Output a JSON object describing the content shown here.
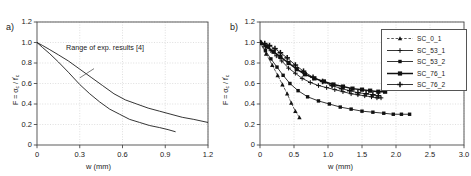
{
  "figure": {
    "panel_a_label": "a)",
    "panel_b_label": "b)",
    "xlabel": "w (mm)",
    "ylabel_prefix": "F = ",
    "ylabel_sigma": "σ",
    "ylabel_sigma_sub": "c",
    "ylabel_slash": " / ",
    "ylabel_f": "f",
    "ylabel_f_sup": "'",
    "ylabel_f_sub": "c",
    "annotation_a": "Range of exp. results [4]"
  },
  "chart_data": [
    {
      "type": "line",
      "panel": "a)",
      "title": "",
      "xlabel": "w (mm)",
      "ylabel": "F = σc / f'c",
      "xlim": [
        0,
        1.2
      ],
      "ylim": [
        0,
        1.2
      ],
      "xticks": [
        0,
        0.3,
        0.6,
        0.9,
        1.2
      ],
      "xtick_labels": [
        "0",
        "0.3",
        "0.6",
        "0.9",
        "1.2"
      ],
      "yticks": [
        0,
        0.2,
        0.4,
        0.6,
        0.8,
        1.0,
        1.2
      ],
      "ytick_labels": [
        "0",
        "0.2",
        "0.4",
        "0.6",
        "0.8",
        "1.0",
        "1.2"
      ],
      "grid": true,
      "legend": "none",
      "annotations": [
        {
          "text": "Range of exp. results [4]",
          "x": 0.42,
          "y": 0.8
        }
      ],
      "series": [
        {
          "name": "upper-envelope",
          "style": "solid",
          "x": [
            0.0,
            0.04,
            0.09,
            0.15,
            0.22,
            0.3,
            0.38,
            0.46,
            0.54,
            0.62,
            0.7,
            0.78,
            0.86,
            0.94,
            1.02,
            1.1,
            1.2
          ],
          "y": [
            1.0,
            0.97,
            0.93,
            0.88,
            0.82,
            0.74,
            0.66,
            0.58,
            0.5,
            0.44,
            0.4,
            0.36,
            0.33,
            0.3,
            0.27,
            0.25,
            0.22
          ]
        },
        {
          "name": "lower-envelope",
          "style": "solid",
          "x": [
            0.0,
            0.04,
            0.09,
            0.15,
            0.22,
            0.3,
            0.37,
            0.44,
            0.51,
            0.58,
            0.65,
            0.72,
            0.79,
            0.86,
            0.92,
            0.97
          ],
          "y": [
            1.0,
            0.95,
            0.89,
            0.81,
            0.71,
            0.59,
            0.5,
            0.42,
            0.35,
            0.3,
            0.25,
            0.22,
            0.19,
            0.17,
            0.15,
            0.13
          ]
        }
      ]
    },
    {
      "type": "line",
      "panel": "b)",
      "title": "",
      "xlabel": "w (mm)",
      "ylabel": "F = σc / f'c",
      "xlim": [
        0,
        3.0
      ],
      "ylim": [
        0,
        1.2
      ],
      "xticks": [
        0,
        0.5,
        1.0,
        1.5,
        2.0,
        2.5,
        3.0
      ],
      "xtick_labels": [
        "0",
        "0.5",
        "1.0",
        "1.5",
        "2.0",
        "2.5",
        "3.0"
      ],
      "yticks": [
        0,
        0.2,
        0.4,
        0.6,
        0.8,
        1.0,
        1.2
      ],
      "ytick_labels": [
        "0",
        "0.2",
        "0.4",
        "0.6",
        "0.8",
        "1.0",
        "1.2"
      ],
      "grid": true,
      "legend": "upper right",
      "series": [
        {
          "name": "SC_0_1",
          "marker": "triangle",
          "style": "dashed",
          "x": [
            0.0,
            0.09,
            0.18,
            0.26,
            0.33,
            0.4,
            0.46,
            0.52,
            0.58
          ],
          "y": [
            1.0,
            0.89,
            0.78,
            0.68,
            0.59,
            0.5,
            0.41,
            0.33,
            0.27
          ]
        },
        {
          "name": "SC_53_1",
          "marker": "plus",
          "style": "solid",
          "x": [
            0.0,
            0.08,
            0.16,
            0.24,
            0.32,
            0.42,
            0.52,
            0.62,
            0.74,
            0.86,
            0.98,
            1.1,
            1.22,
            1.34,
            1.44,
            1.54,
            1.64,
            1.72,
            1.78
          ],
          "y": [
            1.0,
            0.96,
            0.92,
            0.87,
            0.82,
            0.75,
            0.7,
            0.65,
            0.61,
            0.58,
            0.56,
            0.54,
            0.52,
            0.5,
            0.49,
            0.48,
            0.47,
            0.46,
            0.46
          ]
        },
        {
          "name": "SC_53_2",
          "marker": "square-small",
          "style": "solid",
          "x": [
            0.0,
            0.08,
            0.16,
            0.25,
            0.34,
            0.44,
            0.56,
            0.7,
            0.86,
            1.02,
            1.18,
            1.34,
            1.5,
            1.66,
            1.82,
            1.96,
            2.08,
            2.2
          ],
          "y": [
            1.0,
            0.92,
            0.84,
            0.76,
            0.68,
            0.6,
            0.53,
            0.47,
            0.43,
            0.4,
            0.37,
            0.35,
            0.33,
            0.32,
            0.31,
            0.3,
            0.3,
            0.3
          ]
        },
        {
          "name": "SC_76_1",
          "marker": "square-filled",
          "style": "bold",
          "x": [
            0.0,
            0.1,
            0.2,
            0.3,
            0.42,
            0.54,
            0.66,
            0.8,
            0.94,
            1.08,
            1.22,
            1.36,
            1.5,
            1.62,
            1.74,
            1.84
          ],
          "y": [
            1.0,
            0.96,
            0.91,
            0.86,
            0.8,
            0.74,
            0.69,
            0.65,
            0.62,
            0.59,
            0.57,
            0.55,
            0.54,
            0.53,
            0.52,
            0.52
          ]
        },
        {
          "name": "SC_76_2",
          "marker": "plus-bold",
          "style": "solid",
          "x": [
            0.0,
            0.07,
            0.14,
            0.22,
            0.3,
            0.4,
            0.52,
            0.64,
            0.78,
            0.92,
            1.06,
            1.2,
            1.32,
            1.44,
            1.56,
            1.66,
            1.74
          ],
          "y": [
            1.0,
            0.99,
            0.97,
            0.94,
            0.9,
            0.85,
            0.78,
            0.72,
            0.66,
            0.62,
            0.58,
            0.55,
            0.53,
            0.51,
            0.5,
            0.49,
            0.48
          ]
        }
      ],
      "legend_entries": [
        {
          "label": "SC_0_1",
          "marker": "triangle",
          "style": "dashed"
        },
        {
          "label": "SC_53_1",
          "marker": "plus",
          "style": "solid"
        },
        {
          "label": "SC_53_2",
          "marker": "square-small",
          "style": "solid"
        },
        {
          "label": "SC_76_1",
          "marker": "square-filled",
          "style": "bold"
        },
        {
          "label": "SC_76_2",
          "marker": "plus-bold",
          "style": "solid"
        }
      ]
    }
  ]
}
